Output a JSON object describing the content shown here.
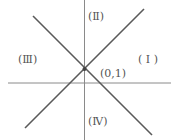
{
  "diagram": {
    "type": "coordinate-regions",
    "colors": {
      "axis": "#8a8a8a",
      "line": "#5a5a5a",
      "text": "#555555",
      "background": "#ffffff"
    },
    "point": {
      "label": "(0,1)",
      "x": 84,
      "y": 69
    },
    "regions": [
      {
        "id": "I",
        "label": "( I )"
      },
      {
        "id": "II",
        "label": "(Ⅱ)"
      },
      {
        "id": "III",
        "label": "(Ⅲ)"
      },
      {
        "id": "IV",
        "label": "(Ⅳ)"
      }
    ]
  }
}
